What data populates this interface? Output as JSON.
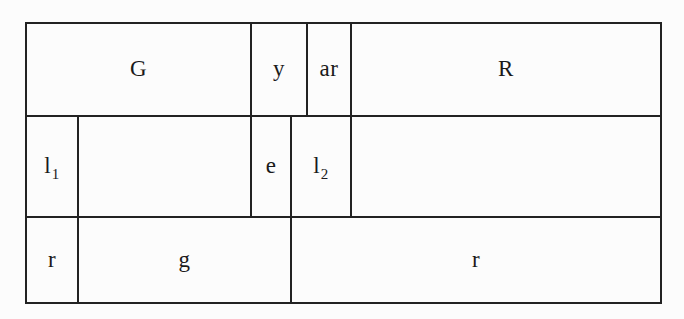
{
  "page": {
    "colors": {
      "background": "#fcfcfc",
      "line": "#222222",
      "text": "#1a1a1a"
    }
  },
  "diagram": {
    "rows": [
      {
        "cells": [
          {
            "label": "G"
          },
          {
            "label": "y"
          },
          {
            "label": "ar"
          },
          {
            "label": "R"
          }
        ]
      },
      {
        "cells": [
          {
            "label": "l",
            "sub": "1"
          },
          {
            "label": ""
          },
          {
            "label": "e"
          },
          {
            "label": "l",
            "sub": "2"
          },
          {
            "label": ""
          }
        ]
      },
      {
        "cells": [
          {
            "label": "r"
          },
          {
            "label": "g"
          },
          {
            "label": "r"
          }
        ]
      }
    ]
  }
}
